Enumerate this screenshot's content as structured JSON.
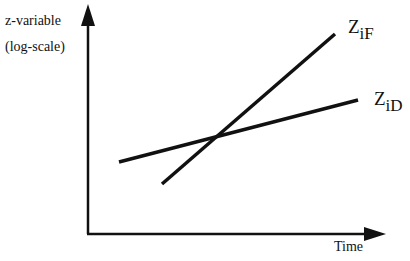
{
  "diagram": {
    "y_axis_label_line1": "z-variable",
    "y_axis_label_line2": "(log-scale)",
    "x_axis_label": "Time",
    "lines": [
      {
        "name": "Z_iF",
        "main": "Z",
        "sub": "iF",
        "start": [
          162,
          184
        ],
        "end": [
          335,
          34
        ]
      },
      {
        "name": "Z_iD",
        "main": "Z",
        "sub": "iD",
        "start": [
          119,
          162
        ],
        "end": [
          358,
          100
        ]
      }
    ],
    "line_color": "#111111"
  }
}
